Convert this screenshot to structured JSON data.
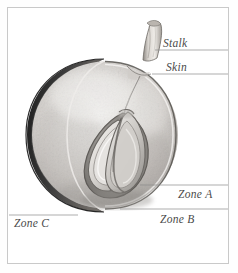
{
  "figure": {
    "type": "botanical-cross-section-illustration",
    "style": "grayscale pencil/graphite rendering",
    "background_color": "#ffffff",
    "frame_color": "#c9c9c9",
    "label_color": "#4a4a4a",
    "leader_line_color": "#8a8a8a"
  },
  "labels": {
    "stalk": "Stalk",
    "skin": "Skin",
    "zone_a": "Zone A",
    "zone_b": "Zone B",
    "zone_c": "Zone C"
  },
  "anatomy": {
    "stalk": "Stalk",
    "skin": "Skin",
    "zones": [
      {
        "id": "zone_a",
        "label": "Zone A"
      },
      {
        "id": "zone_b",
        "label": "Zone B"
      },
      {
        "id": "zone_c",
        "label": "Zone C"
      }
    ],
    "core": "seed cavity with two teardrop lobes"
  },
  "colors": {
    "rind_dark": "#2e2e2e",
    "rind_mid": "#5c5c5c",
    "flesh_light": "#e3e1de",
    "flesh_mid": "#c7c4c0",
    "flesh_shadow": "#9a9793",
    "seed_outline": "#6f6c68",
    "seed_fill": "#b8b5b1"
  }
}
